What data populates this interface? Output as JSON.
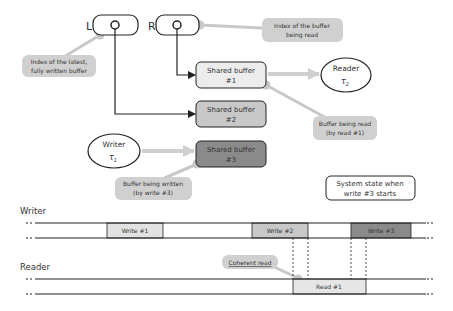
{
  "registers": {
    "left": {
      "label": "L"
    },
    "right": {
      "label": "R"
    }
  },
  "callouts": {
    "latest_index": [
      "Index of the latest,",
      "fully written buffer"
    ],
    "read_index": [
      "Index of the buffer",
      "being read"
    ],
    "buffer_read": [
      "Buffer being read",
      "(by read #1)"
    ],
    "buffer_written": [
      "Buffer being written",
      "(by write #3)"
    ],
    "coherent_read": "Coherent read"
  },
  "buffers": [
    {
      "line1": "Shared buffer",
      "line2": "#1",
      "fill": "#ececec"
    },
    {
      "line1": "Shared buffer",
      "line2": "#2",
      "fill": "#c8c8c8"
    },
    {
      "line1": "Shared buffer",
      "line2": "#3",
      "fill": "#8a8a8a"
    }
  ],
  "tasks": {
    "reader": {
      "name": "Reader",
      "symbol": "τ",
      "sub": "2"
    },
    "writer": {
      "name": "Writer",
      "symbol": "τ",
      "sub": "1"
    }
  },
  "state_note": [
    "System state when",
    "write #3 starts"
  ],
  "timeline": {
    "writer_label": "Writer",
    "reader_label": "Reader",
    "writes": [
      {
        "label": "Write #1",
        "fill": "#e2e2e2"
      },
      {
        "label": "Write #2",
        "fill": "#c8c8c8"
      },
      {
        "label": "Write #3",
        "fill": "#8a8a8a"
      }
    ],
    "reads": [
      {
        "label": "Read #1",
        "fill": "#e6e6e6"
      }
    ]
  },
  "colors": {
    "callout_fill": "#d0d0d0",
    "connector": "#c8c8c8",
    "stroke": "#222222"
  }
}
